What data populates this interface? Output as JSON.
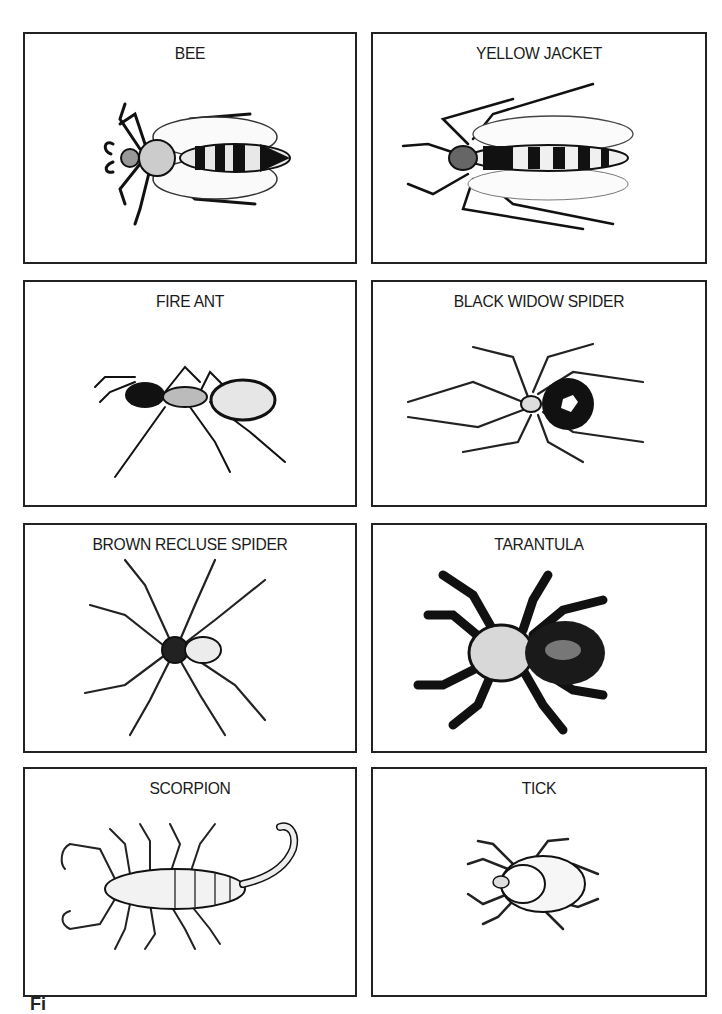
{
  "figure": {
    "panels": [
      {
        "id": "bee",
        "label": "BEE"
      },
      {
        "id": "yellow-jacket",
        "label": "YELLOW JACKET"
      },
      {
        "id": "fire-ant",
        "label": "FIRE ANT"
      },
      {
        "id": "black-widow-spider",
        "label": "BLACK WIDOW SPIDER"
      },
      {
        "id": "brown-recluse-spider",
        "label": "BROWN RECLUSE SPIDER"
      },
      {
        "id": "tarantula",
        "label": "TARANTULA"
      },
      {
        "id": "scorpion",
        "label": "SCORPION"
      },
      {
        "id": "tick",
        "label": "TICK"
      }
    ],
    "caption": "Fi"
  }
}
